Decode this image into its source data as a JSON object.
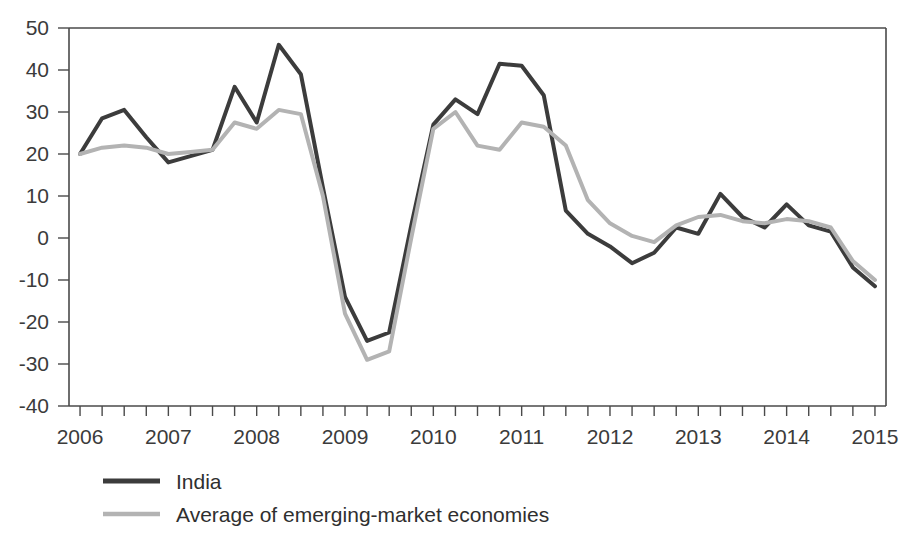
{
  "chart_data": {
    "type": "line",
    "title": "",
    "subtitle": "",
    "xlabel": "",
    "ylabel": "",
    "xlim": [
      2005.875,
      2015.125
    ],
    "ylim": [
      -40,
      50
    ],
    "yticks": [
      50,
      40,
      30,
      20,
      10,
      0,
      -10,
      -20,
      -30,
      -40
    ],
    "ytick_labels": [
      "50",
      "40",
      "30",
      "20",
      "10",
      "0",
      "-10",
      "-20",
      "-30",
      "-40"
    ],
    "xticks": [
      2006,
      2007,
      2008,
      2009,
      2010,
      2011,
      2012,
      2013,
      2014,
      2015
    ],
    "xtick_labels": [
      "2006",
      "2007",
      "2008",
      "2009",
      "2010",
      "2011",
      "2012",
      "2013",
      "2014",
      "2015"
    ],
    "minor_xticks_per_year": 4,
    "grid": false,
    "legend_position": "below-left",
    "x": [
      2006.0,
      2006.25,
      2006.5,
      2006.75,
      2007.0,
      2007.25,
      2007.5,
      2007.75,
      2008.0,
      2008.25,
      2008.5,
      2008.75,
      2009.0,
      2009.25,
      2009.5,
      2009.75,
      2010.0,
      2010.25,
      2010.5,
      2010.75,
      2011.0,
      2011.25,
      2011.5,
      2011.75,
      2012.0,
      2012.25,
      2012.5,
      2012.75,
      2013.0,
      2013.25,
      2013.5,
      2013.75,
      2014.0,
      2014.25,
      2014.5,
      2014.75,
      2015.0
    ],
    "series": [
      {
        "name": "India",
        "color": "#3c3c3c",
        "line_width": 4,
        "values": [
          20,
          28.5,
          30.5,
          24,
          18,
          19.5,
          21,
          36,
          27.5,
          46,
          39,
          12,
          -14,
          -24.5,
          -22.5,
          3,
          27,
          33,
          29.5,
          41.5,
          41,
          34,
          6.5,
          1,
          -2,
          -6,
          -3.5,
          2.5,
          1,
          10.5,
          5,
          2.5,
          8,
          3,
          1.5,
          -7,
          -11.5
        ]
      },
      {
        "name": "Average of emerging-market economies",
        "color": "#b3b3b3",
        "line_width": 4,
        "values": [
          20,
          21.5,
          22,
          21.5,
          20,
          20.5,
          21,
          27.5,
          26,
          30.5,
          29.5,
          10,
          -18,
          -29,
          -27,
          0,
          26,
          30,
          22,
          21,
          27.5,
          26.5,
          22,
          9,
          3.5,
          0.5,
          -1,
          3,
          5,
          5.5,
          4,
          3.5,
          4.5,
          4,
          2.5,
          -5.5,
          -10
        ]
      }
    ]
  },
  "legend": {
    "items": [
      {
        "label": "India",
        "color": "#3c3c3c",
        "style": "solid-dark"
      },
      {
        "label": "Average of emerging-market economies",
        "color": "#b3b3b3",
        "style": "solid-light"
      }
    ]
  }
}
